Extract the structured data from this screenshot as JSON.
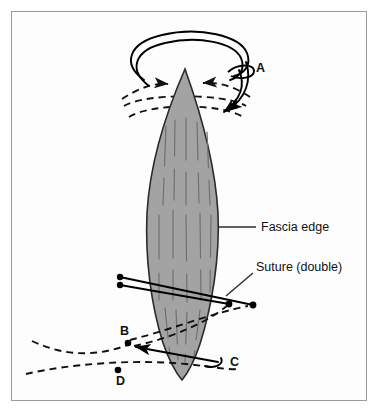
{
  "figure": {
    "frame": {
      "border_color": "#9b9b9b",
      "background_color": "#fdfdfd"
    }
  },
  "colors": {
    "fascia_fill": "#a3a3a3",
    "fascia_stroke": "#2b2b2b",
    "striation": "#6e6e6e",
    "suture_solid": "#000000",
    "suture_dashed": "#111111",
    "label_text": "#111111",
    "leader_line": "#2b2b2b",
    "page_background": "#ffffff"
  },
  "annotations": {
    "fascia_edge": {
      "label": "Fascia edge",
      "leader_from_x": 219,
      "leader_from_y": 227,
      "leader_to_x": 256,
      "leader_to_y": 227,
      "text_x": 261,
      "text_y": 231
    },
    "suture_double": {
      "label": "Suture (double)",
      "leader_from_x": 226,
      "leader_from_y": 296,
      "leader_to_x": 253,
      "leader_to_y": 273,
      "text_x": 256,
      "text_y": 271
    }
  },
  "point_labels": [
    {
      "id": "A",
      "label": "A",
      "text_x": 256,
      "text_y": 72,
      "has_dot": false,
      "dot_x": null,
      "dot_y": null
    },
    {
      "id": "B",
      "label": "B",
      "text_x": 120,
      "text_y": 335,
      "has_dot": true,
      "dot_x": 128,
      "dot_y": 343
    },
    {
      "id": "C",
      "label": "C",
      "text_x": 230,
      "text_y": 366,
      "has_dot": false,
      "dot_x": null,
      "dot_y": null
    },
    {
      "id": "D",
      "label": "D",
      "text_x": 116,
      "text_y": 385,
      "has_dot": true,
      "dot_x": 118,
      "dot_y": 370
    }
  ],
  "fascia": {
    "name": "fascia-edge-shape",
    "description": "Elongated lens / leaf shaped fascia viewed edge on",
    "top_tip_x": 185,
    "top_tip_y": 69,
    "bottom_tip_x": 182,
    "bottom_tip_y": 380,
    "widest_left_x": 146,
    "widest_right_x": 219,
    "widest_y": 222,
    "striation_count": 9
  },
  "suture_elements": {
    "top_loop_label": "suture loop around fascia at A",
    "middle_pair_label": "double suture strand crossing fascia",
    "bottom_dashed_label": "dashed suture path behind fascia through B, C, D",
    "endpoint_dot_radius": 3.2,
    "solid_stroke_width": 1.9,
    "dashed_stroke_width": 1.9,
    "dash_pattern": "7,5"
  }
}
